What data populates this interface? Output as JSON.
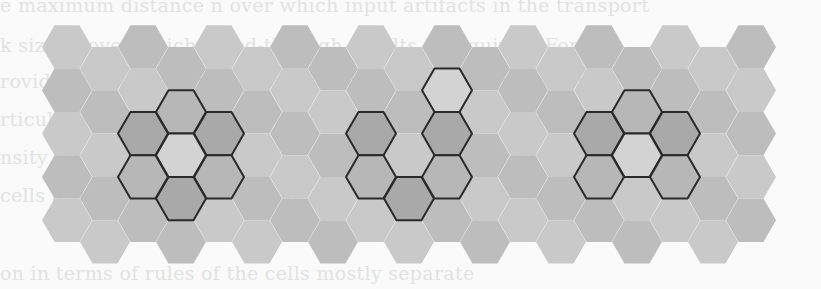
{
  "figure": {
    "grid": {
      "columns": 19,
      "rows": 5,
      "hex_radius": 25,
      "col_step": 38,
      "row_step": 43.3,
      "origin_x": 67,
      "origin_y": 47
    },
    "colors": {
      "background": "#fafafa",
      "outline": "#2a2a2a",
      "shades": [
        "#c9c9c9",
        "#d4d4d4",
        "#bdbdbd",
        "#dadada"
      ],
      "highlight_dark": "#a9a9a9",
      "highlight_mid": "#b7b7b7",
      "highlight_light": "#d3d3d3"
    },
    "clusters": [
      {
        "name": "ring-cluster",
        "cells": [
          [
            3,
            1,
            "mid"
          ],
          [
            2,
            2,
            "dark"
          ],
          [
            4,
            2,
            "dark"
          ],
          [
            2,
            3,
            "mid"
          ],
          [
            4,
            3,
            "mid"
          ],
          [
            3,
            3,
            "dark"
          ],
          [
            3,
            2,
            "light"
          ]
        ]
      },
      {
        "name": "u-cluster",
        "cells": [
          [
            8,
            2,
            "dark"
          ],
          [
            8,
            3,
            "mid"
          ],
          [
            9,
            3,
            "dark"
          ],
          [
            10,
            1,
            "light"
          ],
          [
            10,
            2,
            "dark"
          ],
          [
            10,
            3,
            "mid"
          ]
        ]
      },
      {
        "name": "compact-cluster",
        "cells": [
          [
            15,
            1,
            "mid"
          ],
          [
            14,
            2,
            "dark"
          ],
          [
            16,
            2,
            "dark"
          ],
          [
            15,
            2,
            "light"
          ],
          [
            14,
            3,
            "mid"
          ],
          [
            16,
            3,
            "mid"
          ]
        ]
      }
    ]
  },
  "bleed_text": [
    "e maximum distance n over which input artifacts in the transport",
    "k size m over which bleed-through results is required. For",
    "rovided the distance-fragment between any contiguous cells",
    "rticular region of state by how adjacent the region region has",
    "nsity distribution of cells, with boundaries thereof, where",
    "    cells around the region boundary of the mostly separate",
    "on  in terms of rules of the  cells  mostly  separate"
  ]
}
